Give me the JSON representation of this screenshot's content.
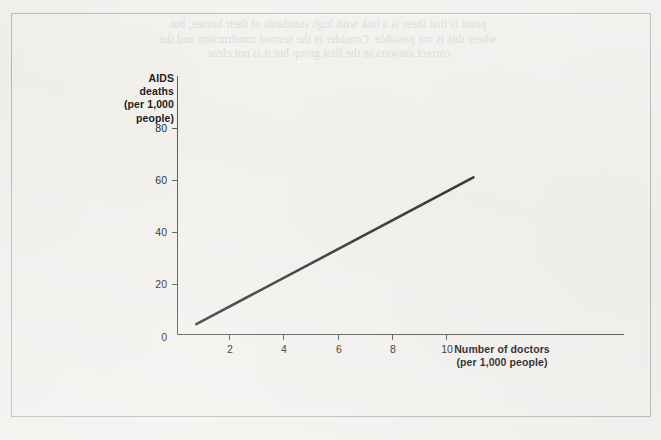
{
  "page": {
    "background_color": "#f3f2ef",
    "frame_color": "#b8b7b4",
    "bleed_through_text": "point is that there is a link with high standards of their homes, but\nwhere this is not possible. Consider in the second construction and the\ncorrect answers in the first group but it is not clear."
  },
  "chart_data": {
    "type": "line",
    "title": "",
    "subtitle": "",
    "xlabel": "Number of doctors\n(per 1,000 people)",
    "ylabel": "AIDS\ndeaths\n(per 1,000\npeople)",
    "xlim": [
      0,
      11.6
    ],
    "ylim": [
      0,
      86
    ],
    "xticks": [
      2,
      4,
      6,
      8,
      10
    ],
    "xtick_labels": [
      "2",
      "4",
      "6",
      "8",
      "10"
    ],
    "yticks": [
      20,
      40,
      60,
      80
    ],
    "ytick_labels": [
      "20",
      "40",
      "60",
      "80"
    ],
    "origin_label": "0",
    "grid": false,
    "legend": false,
    "legend_position": "none",
    "line_color": "#3a3a3a",
    "line_width": 2.6,
    "axis_color": "#5a5a5a",
    "series": [
      {
        "name": "AIDS deaths vs doctors",
        "x": [
          0.7,
          11.0
        ],
        "y": [
          4.0,
          61.0
        ],
        "points": [
          {
            "x": 0.7,
            "y": 4.0
          },
          {
            "x": 11.0,
            "y": 61.0
          }
        ]
      }
    ],
    "annotations": []
  }
}
